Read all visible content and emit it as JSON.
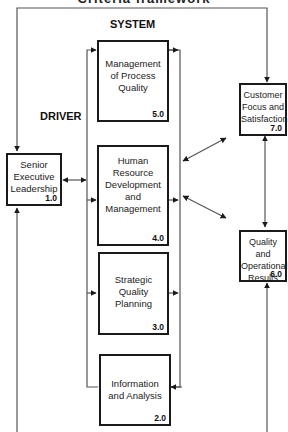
{
  "header": {
    "title": "Criteria framework"
  },
  "sections": {
    "system": "SYSTEM",
    "driver": "DRIVER"
  },
  "boxes": {
    "senior": {
      "label": "Senior\nExecutive\nLeadership",
      "lines": [
        "Senior",
        "Executive",
        "Leadership"
      ],
      "number": "1.0"
    },
    "info": {
      "lines": [
        "Information",
        "and Analysis"
      ],
      "number": "2.0"
    },
    "strategic": {
      "lines": [
        "Strategic",
        "Quality",
        "Planning"
      ],
      "number": "3.0"
    },
    "hr": {
      "lines": [
        "Human",
        "Resource",
        "Development",
        "and",
        "Management"
      ],
      "number": "4.0"
    },
    "process": {
      "lines": [
        "Management",
        "of Process",
        "Quality"
      ],
      "number": "5.0"
    },
    "results": {
      "lines": [
        "Quality and",
        "Operational",
        "Results"
      ],
      "number": "6.0"
    },
    "customer": {
      "lines": [
        "Customer",
        "Focus and",
        "Satisfaction"
      ],
      "number": "7.0"
    }
  },
  "colors": {
    "line": "#555555",
    "box_border": "#1a1a1a",
    "background": "#ffffff"
  }
}
